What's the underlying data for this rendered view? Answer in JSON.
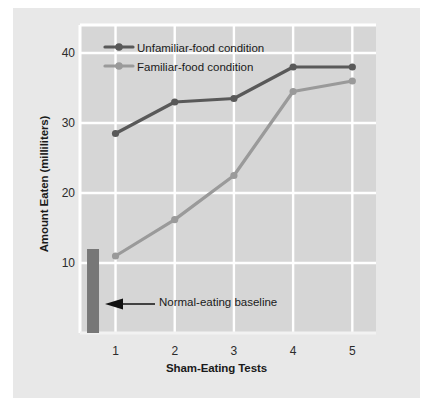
{
  "figure": {
    "background_color": "#e8e8e8",
    "plot_background_color": "#d6d6d6",
    "gridline_color": "#ffffff"
  },
  "chart_data": {
    "type": "line",
    "title": "",
    "xlabel": "Sham-Eating Tests",
    "ylabel": "Amount Eaten (milliliters)",
    "categories": [
      "1",
      "2",
      "3",
      "4",
      "5"
    ],
    "x": [
      1,
      2,
      3,
      4,
      5
    ],
    "xlim": [
      0.4,
      5.4
    ],
    "ylim": [
      0,
      44
    ],
    "yticks": [
      10,
      20,
      30,
      40
    ],
    "ytick_labels": [
      "10",
      "20",
      "30",
      "40"
    ],
    "xticks": [
      1,
      2,
      3,
      4,
      5
    ],
    "xtick_labels": [
      "1",
      "2",
      "3",
      "4",
      "5"
    ],
    "grid": true,
    "legend_position": "top-left",
    "series": [
      {
        "name": "Unfamiliar-food condition",
        "color": "#595959",
        "marker": "circle",
        "values": [
          28.5,
          33.0,
          33.5,
          38.0,
          38.0
        ]
      },
      {
        "name": "Familiar-food condition",
        "color": "#9a9a9a",
        "marker": "circle",
        "values": [
          11.0,
          16.2,
          22.5,
          34.5,
          36.0
        ]
      }
    ],
    "bars": [
      {
        "name": "Normal-eating baseline",
        "color": "#777777",
        "x": 0.62,
        "value": 12.0
      }
    ],
    "annotations": [
      {
        "text": "Normal-eating baseline",
        "arrow": "left-arrow",
        "target_x": 0.62,
        "target_y": 5.5
      }
    ]
  },
  "legend": {
    "entries": [
      {
        "label": "Unfamiliar-food condition",
        "color": "#595959"
      },
      {
        "label": "Familiar-food condition",
        "color": "#9a9a9a"
      }
    ]
  },
  "axes": {
    "y_title": "Amount Eaten (milliliters)",
    "x_title": "Sham-Eating Tests",
    "y_tick_labels": [
      "40",
      "30",
      "20",
      "10"
    ],
    "x_tick_labels": [
      "1",
      "2",
      "3",
      "4",
      "5"
    ]
  },
  "annotation": {
    "baseline_label": "Normal-eating baseline"
  }
}
